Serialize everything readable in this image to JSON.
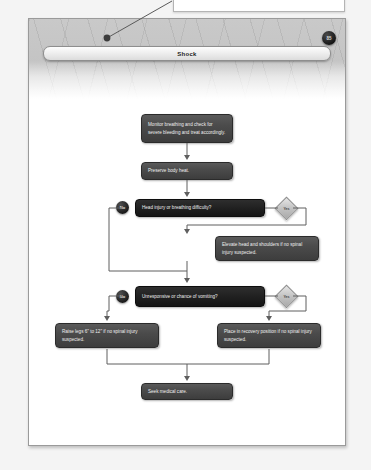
{
  "document": {
    "page_badge": "85",
    "title": "Shock"
  },
  "callout": {
    "text": ""
  },
  "flowchart": {
    "type": "flowchart",
    "nodes": [
      {
        "id": "n1",
        "shape": "process",
        "text": "Monitor breathing and check for severe bleeding and treat accordingly."
      },
      {
        "id": "n2",
        "shape": "process",
        "text": "Preserve body heat."
      },
      {
        "id": "d1",
        "shape": "decision",
        "text": "Head injury or breathing difficulty?"
      },
      {
        "id": "n3",
        "shape": "process",
        "text": "Elevate head and shoulders if no spinal injury suspected."
      },
      {
        "id": "d2",
        "shape": "decision",
        "text": "Unresponsive or chance of vomiting?"
      },
      {
        "id": "n4",
        "shape": "process",
        "text": "Raise legs 6\" to 12\" if no spinal injury suspected."
      },
      {
        "id": "n5",
        "shape": "process",
        "text": "Place in recovery position if no spinal injury suspected."
      },
      {
        "id": "n6",
        "shape": "process",
        "text": "Seek medical care."
      }
    ],
    "branch_labels": {
      "no": "No",
      "yes": "Yes"
    },
    "edges": [
      {
        "from": "n1",
        "to": "n2",
        "label": ""
      },
      {
        "from": "n2",
        "to": "d1",
        "label": ""
      },
      {
        "from": "d1",
        "to": "n3",
        "label": "Yes"
      },
      {
        "from": "d1",
        "to": "d2",
        "label": "No"
      },
      {
        "from": "n3",
        "to": "d2",
        "label": ""
      },
      {
        "from": "d2",
        "to": "n5",
        "label": "Yes"
      },
      {
        "from": "d2",
        "to": "n4",
        "label": "No"
      },
      {
        "from": "n4",
        "to": "n6",
        "label": ""
      },
      {
        "from": "n5",
        "to": "n6",
        "label": ""
      }
    ]
  },
  "colors": {
    "node_fill": "#4b4b4b",
    "decision_fill": "#222222",
    "branch_no_fill": "#1b1b1b",
    "branch_yes_fill": "#c2c2c2",
    "header_band": "#c4c4c4",
    "page_bg": "#ffffff"
  }
}
